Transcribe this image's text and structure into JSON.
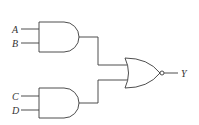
{
  "diagram": {
    "type": "logic-circuit",
    "inputs": [
      {
        "label": "A",
        "gate": "and-1"
      },
      {
        "label": "B",
        "gate": "and-1"
      },
      {
        "label": "C",
        "gate": "and-2"
      },
      {
        "label": "D",
        "gate": "and-2"
      }
    ],
    "gates": [
      {
        "id": "and-1",
        "kind": "AND",
        "inputs": [
          "A",
          "B"
        ]
      },
      {
        "id": "and-2",
        "kind": "AND",
        "inputs": [
          "C",
          "D"
        ]
      },
      {
        "id": "nor-1",
        "kind": "NOR",
        "inputs": [
          "and-1",
          "and-2"
        ]
      }
    ],
    "output": {
      "label": "Y",
      "from": "nor-1"
    },
    "colors": {
      "stroke": "#3a3a3a",
      "background": "#ffffff"
    }
  }
}
